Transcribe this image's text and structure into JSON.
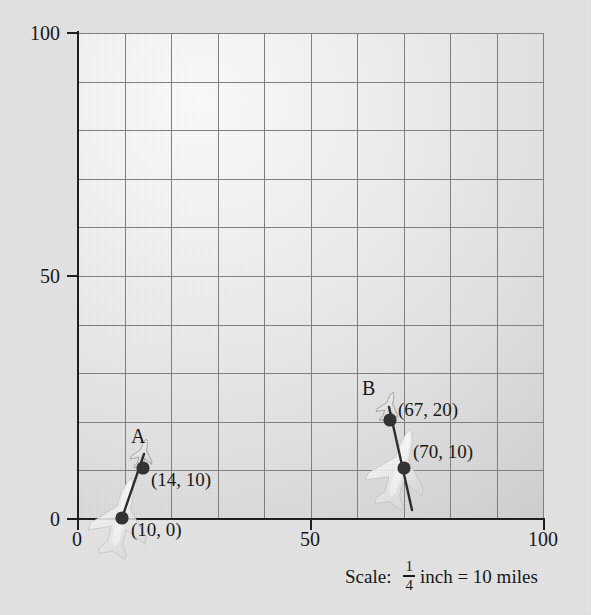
{
  "figure": {
    "background_color": "#e4e4e4",
    "plot_fill_light": "#fdfdfd",
    "plot_fill_dark": "#c4c4c4",
    "grid_color": "#7f7f7f",
    "axis_color": "#1b1b1b",
    "marker_color": "#2e2e2e"
  },
  "chart_data": {
    "type": "scatter",
    "title": "",
    "xlabel": "",
    "ylabel": "",
    "xlim": [
      0,
      100
    ],
    "ylim": [
      0,
      100
    ],
    "grid": true,
    "grid_step": 10,
    "legend": "none",
    "x_ticks": [
      "0",
      "50",
      "100"
    ],
    "x_tick_values": [
      0,
      50,
      100
    ],
    "y_ticks": [
      "0",
      "50",
      "100"
    ],
    "y_tick_values": [
      0,
      50,
      100
    ],
    "annotations": [
      {
        "text": "A",
        "x": 14,
        "y": 17
      },
      {
        "text": "B",
        "x": 66,
        "y": 27
      }
    ],
    "series": [
      {
        "name": "A",
        "station_label": "A",
        "points": [
          {
            "label": "(14, 10)",
            "x": 14,
            "y": 10
          },
          {
            "label": "(10, 0)",
            "x": 10,
            "y": 0
          }
        ]
      },
      {
        "name": "B",
        "station_label": "B",
        "points": [
          {
            "label": "(67, 20)",
            "x": 67,
            "y": 20
          },
          {
            "label": "(70, 10)",
            "x": 70,
            "y": 10
          }
        ]
      }
    ]
  },
  "axis": {
    "y_100": "100",
    "y_50": "50",
    "y_0": "0",
    "x_0": "0",
    "x_50": "50",
    "x_100": "100"
  },
  "markers": {
    "station_a": "A",
    "station_b": "B",
    "a_upper_label": "(14, 10)",
    "a_lower_label": "(10, 0)",
    "b_upper_label": "(67, 20)",
    "b_lower_label": "(70, 10)"
  },
  "scale": {
    "lead": "Scale:",
    "numerator": "1",
    "denominator": "4",
    "unit_phrase": "inch = 10 miles"
  },
  "icons": {
    "airplane": "airplane-icon",
    "marker_dot": "data-point-dot-icon"
  }
}
